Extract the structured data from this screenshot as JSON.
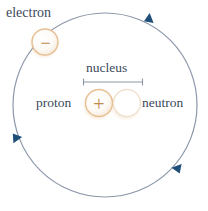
{
  "diagram": {
    "width": 208,
    "height": 211,
    "background_color": "#ffffff",
    "labels": {
      "electron": "electron",
      "nucleus": "nucleus",
      "proton": "proton",
      "neutron": "neutron"
    },
    "symbols": {
      "electron_charge": "−",
      "proton_charge": "+",
      "neutron_charge": ""
    },
    "colors": {
      "orbit_stroke": "#8b97a8",
      "arrow_fill": "#1f4e79",
      "label_text": "#3c4a5c",
      "particle_ring": "#e3b98a",
      "particle_fill": "#fdfbf8",
      "charge_sign": "#c08a4a",
      "bracket_stroke": "#8b97a8"
    },
    "orbit": {
      "center_x": 105,
      "center_y": 105,
      "radius": 92,
      "stroke_width": 1.2,
      "arrow_count": 3,
      "arrow_positions_deg": [
        305,
        185,
        60
      ],
      "direction": "clockwise"
    },
    "particles": [
      {
        "name": "electron",
        "cx": 45,
        "cy": 42,
        "r": 13,
        "sign": "−",
        "on_orbit": true
      },
      {
        "name": "proton",
        "cx": 99,
        "cy": 103,
        "r": 14,
        "sign": "+",
        "on_orbit": false
      },
      {
        "name": "neutron",
        "cx": 127,
        "cy": 103,
        "r": 14,
        "sign": "",
        "on_orbit": false
      }
    ],
    "nucleus_bracket": {
      "x_start": 83,
      "x_end": 143,
      "y": 82,
      "tick_height": 6
    }
  }
}
